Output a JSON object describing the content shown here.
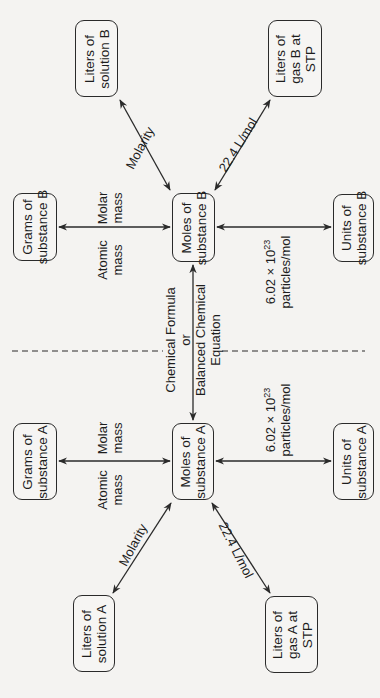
{
  "diagram": {
    "orientation": "rotated 90° counter-clockwise",
    "boxes": {
      "liters_solution_b": {
        "line1": "Liters of",
        "line2": "solution B"
      },
      "liters_gas_b": {
        "line1": "Liters of",
        "line2": "gas B at",
        "line3": "STP"
      },
      "grams_b": {
        "line1": "Grams of",
        "line2": "substance B"
      },
      "moles_b": {
        "line1": "Moles of",
        "line2": "substance B"
      },
      "units_b": {
        "line1": "Units of",
        "line2": "substance B"
      },
      "grams_a": {
        "line1": "Grams of",
        "line2": "substance A"
      },
      "moles_a": {
        "line1": "Moles of",
        "line2": "substance A"
      },
      "units_a": {
        "line1": "Units of",
        "line2": "substance A"
      },
      "liters_solution_a": {
        "line1": "Liters of",
        "line2": "solution A"
      },
      "liters_gas_a": {
        "line1": "Liters of",
        "line2": "gas A at",
        "line3": "STP"
      }
    },
    "edge_labels": {
      "molarity_b": "Molarity",
      "gas_b": "22.4 L/mol",
      "molar_mass_b": {
        "line1": "Molar",
        "line2": "mass"
      },
      "atomic_mass_b": {
        "line1": "Atomic",
        "line2": "mass"
      },
      "avogadro_b": {
        "line1_base": "6.02 × 10",
        "line1_exp": "23",
        "line2": "particles/mol"
      },
      "chemical_link": {
        "line1": "Chemical Formula",
        "line2": "or",
        "line3": "Balanced Chemical",
        "line4": "Equation"
      },
      "molar_mass_a": {
        "line1": "Molar",
        "line2": "mass"
      },
      "atomic_mass_a": {
        "line1": "Atomic",
        "line2": "mass"
      },
      "avogadro_a": {
        "line1_base": "6.02 × 10",
        "line1_exp": "23",
        "line2": "particles/mol"
      },
      "molarity_a": "Molarity",
      "gas_a": "22.4 L/mol"
    },
    "colors": {
      "stroke": "#2a2a2a",
      "background": "#f4f3f1"
    }
  }
}
